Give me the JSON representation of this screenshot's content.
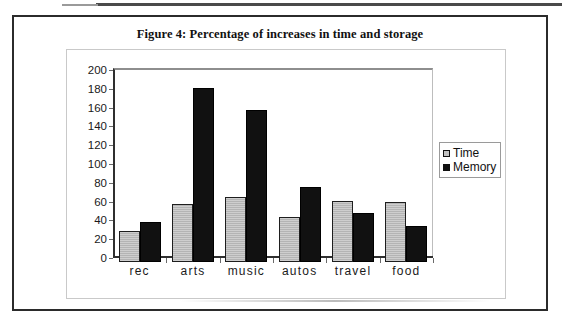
{
  "figure": {
    "title": "Figure 4: Percentage of increases in time and storage"
  },
  "legend": {
    "position": "right",
    "items": [
      {
        "label": "Time",
        "color": "#b4b4b4",
        "marker": "square-outline-icon"
      },
      {
        "label": "Memory",
        "color": "#111111",
        "marker": "square-filled-icon"
      }
    ]
  },
  "axes": {
    "y_ticks": [
      "200",
      "180",
      "160",
      "140",
      "120",
      "100",
      "80",
      "60",
      "40",
      "20",
      "0"
    ],
    "x_ticks": [
      "rec",
      "arts",
      "music",
      "autos",
      "travel",
      "food"
    ]
  },
  "chart_data": {
    "type": "bar",
    "title": "Figure 4: Percentage of increases in time and storage",
    "xlabel": "",
    "ylabel": "",
    "ylim": [
      0,
      200
    ],
    "ytick_step": 20,
    "grid": false,
    "legend_position": "right",
    "categories": [
      "rec",
      "arts",
      "music",
      "autos",
      "travel",
      "food"
    ],
    "series": [
      {
        "name": "Time",
        "color": "#b4b4b4",
        "values": [
          33,
          62,
          69,
          48,
          65,
          64
        ]
      },
      {
        "name": "Memory",
        "color": "#111111",
        "values": [
          43,
          185,
          162,
          80,
          52,
          38
        ]
      }
    ]
  }
}
